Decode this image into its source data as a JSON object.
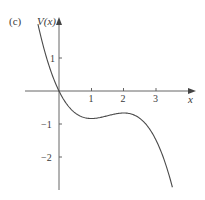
{
  "panel_label": "(c)",
  "chart_data": {
    "type": "line",
    "title": "",
    "xlabel": "x",
    "ylabel": "V(x)",
    "x_ticks": [
      1,
      2,
      3
    ],
    "y_ticks": [
      1,
      -1,
      -2
    ],
    "x_tick_labels": [
      "1",
      "2",
      "3"
    ],
    "y_tick_labels": [
      "1",
      "−1",
      "−2"
    ],
    "xlim": [
      -0.65,
      3.5
    ],
    "ylim": [
      -2.95,
      2.05
    ],
    "grid": false,
    "legend": null,
    "series": [
      {
        "name": "V(x)",
        "x": [
          -0.65,
          -0.5,
          -0.25,
          0,
          0.25,
          0.5,
          0.75,
          1,
          1.25,
          1.5,
          1.75,
          2,
          2.25,
          2.5,
          2.75,
          3,
          3.25,
          3.5
        ],
        "values": [
          2.03,
          1.42,
          0.6,
          0.0,
          -0.42,
          -0.67,
          -0.8,
          -0.83,
          -0.8,
          -0.75,
          -0.7,
          -0.67,
          -0.67,
          -0.73,
          -0.9,
          -1.5,
          -2.03,
          -2.92
        ]
      }
    ],
    "annotations": [
      {
        "text": "local minimum",
        "x": 1,
        "y": -0.83
      },
      {
        "text": "local maximum",
        "x": 2,
        "y": -0.67
      }
    ]
  },
  "style": {
    "axis_color": "#555555",
    "curve_color": "#4a4a4a",
    "text_color": "#3a3a3a",
    "background": "#ffffff"
  }
}
